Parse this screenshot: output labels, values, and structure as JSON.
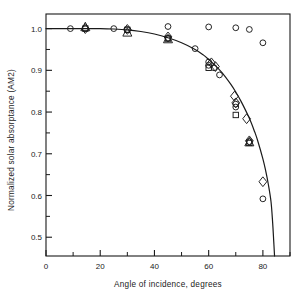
{
  "chart_data": {
    "type": "scatter",
    "title": "",
    "subtitle": "",
    "xlabel": "Angle of incidence, degrees",
    "ylabel": "Normalized solar absorptance (AM2)",
    "xlim": [
      0,
      90
    ],
    "ylim": [
      0.455,
      1.035
    ],
    "grid": false,
    "legend": null,
    "x_major_ticks": [
      0,
      20,
      40,
      60,
      80
    ],
    "x_minor_ticks": [
      10,
      30,
      50,
      70,
      90
    ],
    "x_tick_labels": [
      "0",
      "20",
      "40",
      "60",
      "80"
    ],
    "y_major_ticks": [
      0.5,
      0.6,
      0.7,
      0.8,
      0.9,
      1.0
    ],
    "y_minor_ticks": [
      0.55,
      0.65,
      0.75,
      0.85,
      0.95
    ],
    "y_tick_labels": [
      "0.5",
      "0.6",
      "0.7",
      "0.8",
      "0.9",
      "1.0"
    ],
    "curve": {
      "name": "fitted cosine-like response curve",
      "points": [
        [
          0,
          1.0
        ],
        [
          5,
          1.0
        ],
        [
          10,
          1.0
        ],
        [
          15,
          1.0
        ],
        [
          20,
          1.0
        ],
        [
          25,
          0.999
        ],
        [
          30,
          0.997
        ],
        [
          35,
          0.993
        ],
        [
          40,
          0.987
        ],
        [
          45,
          0.978
        ],
        [
          50,
          0.966
        ],
        [
          55,
          0.95
        ],
        [
          58,
          0.937
        ],
        [
          60,
          0.926
        ],
        [
          62,
          0.914
        ],
        [
          65,
          0.894
        ],
        [
          68,
          0.868
        ],
        [
          70,
          0.848
        ],
        [
          72,
          0.825
        ],
        [
          75,
          0.785
        ],
        [
          77,
          0.752
        ],
        [
          78,
          0.733
        ],
        [
          80,
          0.688
        ],
        [
          81,
          0.66
        ],
        [
          82,
          0.627
        ],
        [
          83,
          0.585
        ],
        [
          83.6,
          0.535
        ],
        [
          84,
          0.49
        ],
        [
          84.3,
          0.455
        ]
      ]
    },
    "series": [
      {
        "name": "circles",
        "marker": "circle",
        "points": [
          [
            9,
            1.0
          ],
          [
            14.5,
            1.0
          ],
          [
            25,
            1.0
          ],
          [
            30,
            0.998
          ],
          [
            45,
            1.005
          ],
          [
            45,
            0.977
          ],
          [
            55,
            0.952
          ],
          [
            60,
            1.004
          ],
          [
            60,
            0.92
          ],
          [
            60,
            0.912
          ],
          [
            62,
            0.906
          ],
          [
            64,
            0.889
          ],
          [
            70,
            1.002
          ],
          [
            70,
            0.819
          ],
          [
            70,
            0.812
          ],
          [
            75,
            0.998
          ],
          [
            75,
            0.729
          ],
          [
            80,
            0.966
          ],
          [
            80,
            0.592
          ]
        ]
      },
      {
        "name": "squares",
        "marker": "square",
        "points": [
          [
            14.5,
            1.0
          ],
          [
            30,
            0.997
          ],
          [
            45,
            0.976
          ],
          [
            60,
            0.906
          ],
          [
            70,
            0.793
          ],
          [
            75,
            0.726
          ]
        ]
      },
      {
        "name": "diamonds",
        "marker": "diamond",
        "points": [
          [
            14.5,
            1.0
          ],
          [
            30,
            0.998
          ],
          [
            45,
            0.98
          ],
          [
            61,
            0.918
          ],
          [
            62.5,
            0.909
          ],
          [
            69.5,
            0.838
          ],
          [
            70,
            0.822
          ],
          [
            74,
            0.784
          ],
          [
            75,
            0.731
          ],
          [
            80,
            0.633
          ]
        ]
      },
      {
        "name": "triangles",
        "marker": "triangle",
        "points": [
          [
            14.5,
            1.003
          ],
          [
            30,
            0.99
          ],
          [
            45,
            0.974
          ],
          [
            75,
            0.727
          ]
        ]
      }
    ]
  }
}
